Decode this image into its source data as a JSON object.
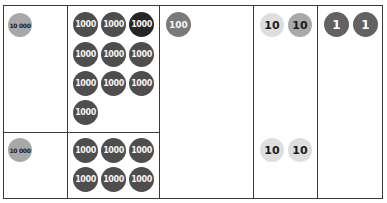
{
  "colors": {
    "border": "#3a3a3a",
    "disc_10000": "#a8a8a8",
    "disc_1000": "#4e4e4e",
    "disc_1000_dark": "#262626",
    "disc_100": "#7a7a7a",
    "disc_10_light": "#dedede",
    "disc_10_mid": "#a9a9a9",
    "disc_1": "#626262"
  },
  "top_row": {
    "ten_thousands": [
      {
        "label": "10 000"
      }
    ],
    "thousands": [
      {
        "label": "1000"
      },
      {
        "label": "1000"
      },
      {
        "label": "1000",
        "shade": "dark"
      },
      {
        "label": "1000"
      },
      {
        "label": "1000"
      },
      {
        "label": "1000"
      },
      {
        "label": "1000"
      },
      {
        "label": "1000"
      },
      {
        "label": "1000"
      },
      {
        "label": "1000"
      }
    ],
    "hundreds": [
      {
        "label": "100"
      }
    ],
    "tens": [
      {
        "label": "10",
        "shade": "light"
      },
      {
        "label": "10",
        "shade": "mid"
      }
    ],
    "ones": [
      {
        "label": "1"
      },
      {
        "label": "1"
      }
    ]
  },
  "bottom_row": {
    "ten_thousands": [
      {
        "label": "10 000"
      }
    ],
    "thousands": [
      {
        "label": "1000"
      },
      {
        "label": "1000"
      },
      {
        "label": "1000"
      },
      {
        "label": "1000"
      },
      {
        "label": "1000"
      },
      {
        "label": "1000"
      }
    ],
    "tens": [
      {
        "label": "10",
        "shade": "light"
      },
      {
        "label": "10",
        "shade": "light"
      }
    ]
  }
}
